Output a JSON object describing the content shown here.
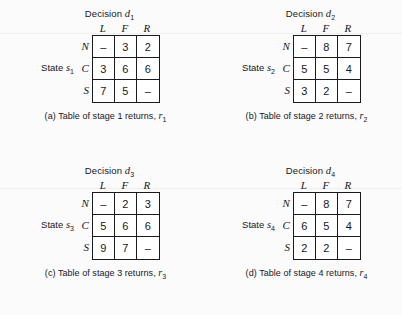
{
  "figure": {
    "background": "#fbfbfc",
    "ink": "#16171a",
    "panels": [
      {
        "id": "panel-a",
        "title_prefix": "Decision",
        "title_var": "d",
        "title_sub": "1",
        "state_prefix": "State",
        "state_var": "s",
        "state_sub": "1",
        "columns": [
          "L",
          "F",
          "R"
        ],
        "rows": [
          "N",
          "C",
          "S"
        ],
        "values": [
          [
            "–",
            "3",
            "2"
          ],
          [
            "3",
            "6",
            "6"
          ],
          [
            "7",
            "5",
            "–"
          ]
        ],
        "caption_text": "(a) Table of stage 1 returns,",
        "caption_var": "r",
        "caption_sub": "1"
      },
      {
        "id": "panel-b",
        "title_prefix": "Decision",
        "title_var": "d",
        "title_sub": "2",
        "state_prefix": "State",
        "state_var": "s",
        "state_sub": "2",
        "columns": [
          "L",
          "F",
          "R"
        ],
        "rows": [
          "N",
          "C",
          "S"
        ],
        "values": [
          [
            "–",
            "8",
            "7"
          ],
          [
            "5",
            "5",
            "4"
          ],
          [
            "3",
            "2",
            "–"
          ]
        ],
        "caption_text": "(b) Table of stage 2 returns,",
        "caption_var": "r",
        "caption_sub": "2"
      },
      {
        "id": "panel-c",
        "title_prefix": "Decision",
        "title_var": "d",
        "title_sub": "3",
        "state_prefix": "State",
        "state_var": "s",
        "state_sub": "3",
        "columns": [
          "L",
          "F",
          "R"
        ],
        "rows": [
          "N",
          "C",
          "S"
        ],
        "values": [
          [
            "–",
            "2",
            "3"
          ],
          [
            "5",
            "6",
            "6"
          ],
          [
            "9",
            "7",
            "–"
          ]
        ],
        "caption_text": "(c) Table of stage 3 returns,",
        "caption_var": "r",
        "caption_sub": "3"
      },
      {
        "id": "panel-d",
        "title_prefix": "Decision",
        "title_var": "d",
        "title_sub": "4",
        "state_prefix": "State",
        "state_var": "s",
        "state_sub": "4",
        "columns": [
          "L",
          "F",
          "R"
        ],
        "rows": [
          "N",
          "C",
          "S"
        ],
        "values": [
          [
            "–",
            "8",
            "7"
          ],
          [
            "6",
            "5",
            "4"
          ],
          [
            "2",
            "2",
            "–"
          ]
        ],
        "caption_text": "(d) Table of stage 4 returns,",
        "caption_var": "r",
        "caption_sub": "4"
      }
    ]
  }
}
